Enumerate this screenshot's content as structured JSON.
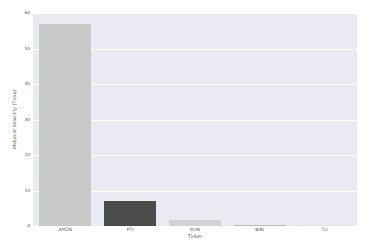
{
  "chart_data": {
    "type": "bar",
    "title": "",
    "subtitle": "",
    "xlabel": "Ticker",
    "ylabel": "Midpoint Volatility (Ticks)",
    "categories": [
      "AMZN",
      "PTI",
      "RUN",
      "BIRI",
      "TLI"
    ],
    "values": [
      57.0,
      7.0,
      1.8,
      0.3,
      0.05
    ],
    "bar_colors": [
      "#c9c9c9",
      "#4b4b4b",
      "#d2d2d2",
      "#b9b9b9",
      "#e0e0e0"
    ],
    "ylim": [
      0,
      60
    ],
    "xlim": [
      -0.5,
      4.5
    ],
    "yticks": [
      0,
      10,
      20,
      30,
      40,
      50,
      60
    ],
    "ytick_labels": [
      "0",
      "10",
      "20",
      "30",
      "40",
      "50",
      "60"
    ],
    "grid": true,
    "grid_axis": "y",
    "grid_color": "#ffffff",
    "legend": false,
    "legend_position": "none",
    "plot_background": "#eaeaf2",
    "figure_background": "#ffffff",
    "tick_label_color": "#555555",
    "axis_label_color": "#4d4d4d",
    "series": [
      {
        "name": "Midpoint Volatility (Ticks)",
        "values": [
          57.0,
          7.0,
          1.8,
          0.3,
          0.05
        ]
      }
    ]
  }
}
